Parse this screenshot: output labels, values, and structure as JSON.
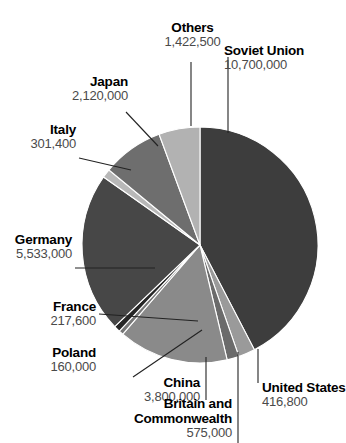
{
  "chart_data": {
    "type": "pie",
    "title": "",
    "subtitle": "",
    "xlabel": "",
    "ylabel": "",
    "legend_position": "callout-labels",
    "grid": false,
    "units": "people",
    "total": 25246800,
    "categories": [
      "Soviet Union",
      "Germany",
      "China",
      "Japan",
      "Others",
      "Britain and Commonwealth",
      "United States",
      "Italy",
      "France",
      "Poland"
    ],
    "values": [
      10700000,
      5533000,
      3800000,
      2120000,
      1422500,
      575000,
      416800,
      301400,
      217600,
      160000
    ],
    "value_labels": [
      "10,700,000",
      "5,533,000",
      "3,800,000",
      "2,120,000",
      "1,422,500",
      "575,000",
      "416,800",
      "301,400",
      "217,600",
      "160,000"
    ],
    "slice_colors": [
      "#3d3d3d",
      "#474747",
      "#8a8a8a",
      "#6e6e6e",
      "#b2b2b2",
      "#9a9a9a",
      "#6b6b6b",
      "#b8b8b8",
      "#262626",
      "#777777"
    ]
  },
  "slices": [
    {
      "name": "Soviet Union",
      "value_label": "10,700,000",
      "color": "#3d3d3d",
      "start_angle": 0,
      "end_angle": 152.56
    },
    {
      "name": "Britain and Commonwealth",
      "value_label": "575,000",
      "color": "#9a9a9a",
      "start_angle": 152.56,
      "end_angle": 160.76
    },
    {
      "name": "United States",
      "value_label": "416,800",
      "color": "#6b6b6b",
      "start_angle": 160.76,
      "end_angle": 166.7
    },
    {
      "name": "China",
      "value_label": "3,800,000",
      "color": "#8a8a8a",
      "start_angle": 166.7,
      "end_angle": 220.89
    },
    {
      "name": "Poland",
      "value_label": "160,000",
      "color": "#777777",
      "start_angle": 220.89,
      "end_angle": 223.17
    },
    {
      "name": "France",
      "value_label": "217,600",
      "color": "#262626",
      "start_angle": 223.17,
      "end_angle": 226.27
    },
    {
      "name": "Germany",
      "value_label": "5,533,000",
      "color": "#474747",
      "start_angle": 226.27,
      "end_angle": 305.19
    },
    {
      "name": "Italy",
      "value_label": "301,400",
      "color": "#b8b8b8",
      "start_angle": 305.19,
      "end_angle": 309.49
    },
    {
      "name": "Japan",
      "value_label": "2,120,000",
      "color": "#6e6e6e",
      "start_angle": 309.49,
      "end_angle": 339.72
    },
    {
      "name": "Others",
      "value_label": "1,422,500",
      "color": "#b2b2b2",
      "start_angle": 339.72,
      "end_angle": 360
    }
  ],
  "labels": {
    "others": {
      "name": "Others",
      "value": "1,422,500"
    },
    "soviet_union": {
      "name": "Soviet Union",
      "value": "10,700,000"
    },
    "japan": {
      "name": "Japan",
      "value": "2,120,000"
    },
    "italy": {
      "name": "Italy",
      "value": "301,400"
    },
    "germany": {
      "name": "Germany",
      "value": "5,533,000"
    },
    "france": {
      "name": "France",
      "value": "217,600"
    },
    "poland": {
      "name": "Poland",
      "value": "160,000"
    },
    "china": {
      "name": "China",
      "value": "3,800,000"
    },
    "britain": {
      "name": "Britain and Commonwealth",
      "name_line1": "Britain and",
      "name_line2": "Commonwealth",
      "value": "575,000"
    },
    "united_states": {
      "name": "United States",
      "value": "416,800"
    }
  }
}
